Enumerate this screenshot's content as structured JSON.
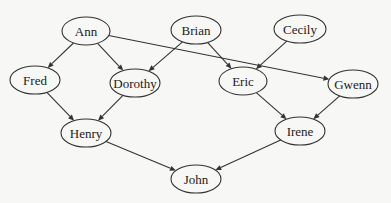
{
  "diagram": {
    "type": "directed-graph",
    "nodes": [
      {
        "id": "ann",
        "label": "Ann",
        "cx": 86,
        "cy": 31,
        "rx": 24,
        "ry": 14
      },
      {
        "id": "brian",
        "label": "Brian",
        "cx": 196,
        "cy": 30,
        "rx": 25,
        "ry": 14
      },
      {
        "id": "cecily",
        "label": "Cecily",
        "cx": 300,
        "cy": 29,
        "rx": 26,
        "ry": 14
      },
      {
        "id": "fred",
        "label": "Fred",
        "cx": 35,
        "cy": 80,
        "rx": 25,
        "ry": 14
      },
      {
        "id": "dorothy",
        "label": "Dorothy",
        "cx": 135,
        "cy": 83,
        "rx": 25,
        "ry": 14
      },
      {
        "id": "eric",
        "label": "Eric",
        "cx": 243,
        "cy": 81,
        "rx": 24,
        "ry": 14
      },
      {
        "id": "gwenn",
        "label": "Gwenn",
        "cx": 353,
        "cy": 84,
        "rx": 25,
        "ry": 14
      },
      {
        "id": "henry",
        "label": "Henry",
        "cx": 86,
        "cy": 133,
        "rx": 25,
        "ry": 14
      },
      {
        "id": "irene",
        "label": "Irene",
        "cx": 300,
        "cy": 131,
        "rx": 25,
        "ry": 14
      },
      {
        "id": "john",
        "label": "John",
        "cx": 196,
        "cy": 179,
        "rx": 25,
        "ry": 14
      }
    ],
    "edges": [
      {
        "from": "ann",
        "to": "fred"
      },
      {
        "from": "ann",
        "to": "dorothy"
      },
      {
        "from": "ann",
        "to": "gwenn"
      },
      {
        "from": "brian",
        "to": "dorothy"
      },
      {
        "from": "brian",
        "to": "eric"
      },
      {
        "from": "cecily",
        "to": "eric"
      },
      {
        "from": "fred",
        "to": "henry"
      },
      {
        "from": "dorothy",
        "to": "henry"
      },
      {
        "from": "eric",
        "to": "irene"
      },
      {
        "from": "gwenn",
        "to": "irene"
      },
      {
        "from": "henry",
        "to": "john"
      },
      {
        "from": "irene",
        "to": "john"
      }
    ]
  }
}
